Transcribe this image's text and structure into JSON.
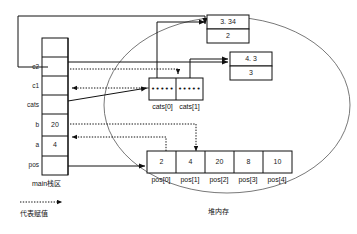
{
  "diagram": {
    "title_regions": {
      "stack_label": "main栈区",
      "heap_label": "堆内存"
    },
    "legend": {
      "text": "代表赋值",
      "arrow_style": "dotted-arrow"
    },
    "stack": {
      "rows": [
        {
          "name": "",
          "label": "",
          "value": ""
        },
        {
          "name": "c2",
          "label": "c2",
          "value": ""
        },
        {
          "name": "c1",
          "label": "c1",
          "value": ""
        },
        {
          "name": "cats",
          "label": "cats",
          "value": ""
        },
        {
          "name": "b",
          "label": "b",
          "value": "20"
        },
        {
          "name": "a",
          "label": "a",
          "value": "4"
        },
        {
          "name": "pos",
          "label": "pos",
          "value": ""
        }
      ]
    },
    "heap": {
      "object_top": {
        "name": "cat-object-1",
        "fields": [
          "3. 34",
          "2"
        ]
      },
      "object_right": {
        "name": "cat-object-2",
        "fields": [
          "4. 3",
          "3"
        ]
      },
      "cats_array": {
        "cells": [
          {
            "value": "•••••",
            "label": "cats[0]"
          },
          {
            "value": "•••••",
            "label": "cats[1]"
          }
        ]
      },
      "pos_array": {
        "cells": [
          {
            "value": "2",
            "label": "pos[0]"
          },
          {
            "value": "4",
            "label": "pos[1]"
          },
          {
            "value": "20",
            "label": "pos[2]"
          },
          {
            "value": "8",
            "label": "pos[3]"
          },
          {
            "value": "10",
            "label": "pos[4]"
          }
        ]
      }
    },
    "colors": {
      "stroke": "#111111",
      "text": "#111111",
      "background": "#ffffff"
    }
  }
}
